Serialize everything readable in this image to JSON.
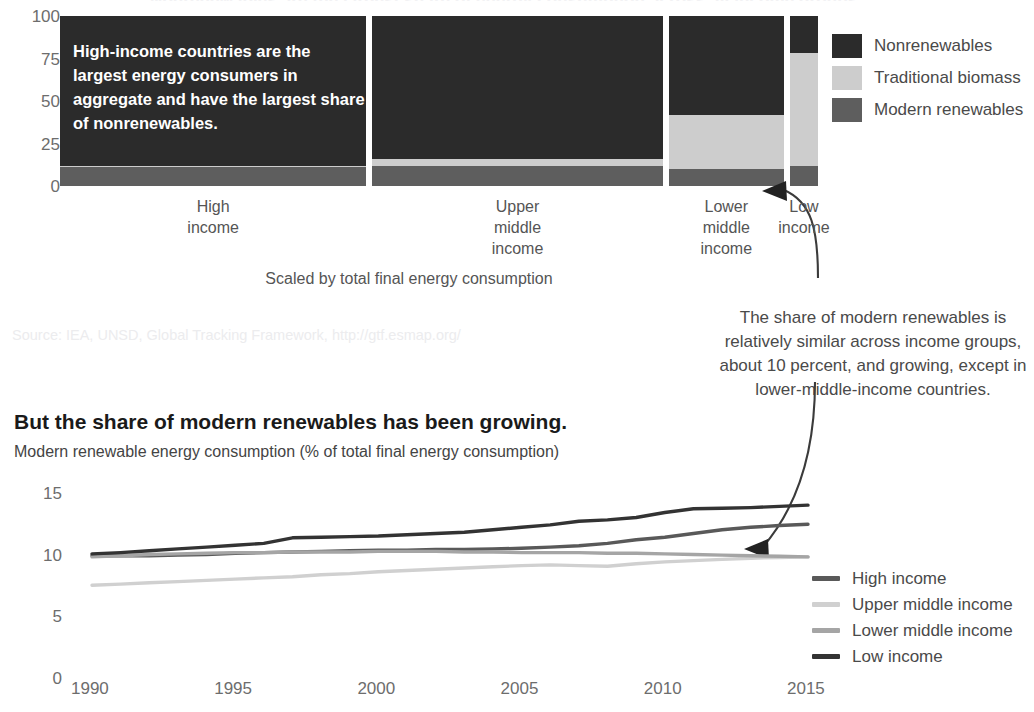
{
  "cutoff_title": "Nonrenewables are the largest share of energy consumption across all income groups.",
  "mekko": {
    "y_ticks": [
      "100",
      "75",
      "50",
      "25",
      "0"
    ],
    "callout": "High-income countries are the largest energy consumers in aggregate and have the largest share of nonrenewables.",
    "scaled_note": "Scaled by total final energy consumption",
    "source": "Source: IEA, UNSD, Global Tracking Framework, http://gtf.esmap.org/",
    "legend": [
      {
        "label": "Nonrenewables",
        "color": "#2b2b2b"
      },
      {
        "label": "Traditional biomass",
        "color": "#cdcdcd"
      },
      {
        "label": "Modern renewables",
        "color": "#5e5e5e"
      }
    ]
  },
  "annotation": "The share of modern renewables is relatively similar across income groups, about 10 percent, and growing, except in lower-middle-income countries.",
  "line": {
    "title": "But the share of modern renewables has been growing.",
    "subtitle": "Modern renewable energy consumption (% of total final energy consumption)",
    "legend": [
      {
        "label": "High income",
        "color": "#595959"
      },
      {
        "label": "Upper middle income",
        "color": "#d0d0d0"
      },
      {
        "label": "Lower middle income",
        "color": "#a5a5a5"
      },
      {
        "label": "Low income",
        "color": "#333333"
      }
    ]
  },
  "chart_data": [
    {
      "type": "bar",
      "subtype": "marimekko-stacked-100",
      "title": "Energy consumption composition by income group",
      "xlabel": "Scaled by total final energy consumption",
      "ylabel": "% of total final energy consumption",
      "ylim": [
        0,
        100
      ],
      "y_ticks": [
        0,
        25,
        50,
        75,
        100
      ],
      "grid": false,
      "legend_position": "right",
      "categories": [
        "High income",
        "Upper middle income",
        "Lower middle income",
        "Low income"
      ],
      "category_widths_pct": [
        40.4,
        38.3,
        15.2,
        3.7
      ],
      "series": [
        {
          "name": "Nonrenewables",
          "color": "#2b2b2b",
          "values": [
            88,
            84,
            58,
            22
          ]
        },
        {
          "name": "Traditional biomass",
          "color": "#cdcdcd",
          "values": [
            1,
            4,
            32,
            66
          ]
        },
        {
          "name": "Modern renewables",
          "color": "#5e5e5e",
          "values": [
            11,
            12,
            10,
            12
          ]
        }
      ]
    },
    {
      "type": "line",
      "title": "But the share of modern renewables has been growing.",
      "subtitle": "Modern renewable energy consumption (% of total final energy consumption)",
      "xlabel": "",
      "ylabel": "Modern renewable energy consumption (% of total final energy consumption)",
      "xlim": [
        1990,
        2015
      ],
      "ylim": [
        0,
        15
      ],
      "x_ticks": [
        1990,
        1995,
        2000,
        2005,
        2010,
        2015
      ],
      "y_ticks": [
        0,
        5,
        10,
        15
      ],
      "grid": false,
      "legend_position": "right",
      "x": [
        1990,
        1991,
        1992,
        1993,
        1994,
        1995,
        1996,
        1997,
        1998,
        1999,
        2000,
        2001,
        2002,
        2003,
        2004,
        2005,
        2006,
        2007,
        2008,
        2009,
        2010,
        2011,
        2012,
        2013,
        2014,
        2015
      ],
      "series": [
        {
          "name": "High income",
          "color": "#595959",
          "values": [
            8.7,
            8.7,
            8.7,
            8.75,
            8.8,
            8.9,
            8.95,
            9.0,
            9.05,
            9.1,
            9.15,
            9.15,
            9.2,
            9.2,
            9.25,
            9.3,
            9.4,
            9.5,
            9.7,
            10.0,
            10.2,
            10.5,
            10.8,
            11.0,
            11.15,
            11.25
          ]
        },
        {
          "name": "Upper middle income",
          "color": "#d0d0d0",
          "values": [
            6.3,
            6.4,
            6.5,
            6.6,
            6.7,
            6.8,
            6.9,
            7.0,
            7.15,
            7.25,
            7.4,
            7.5,
            7.6,
            7.7,
            7.8,
            7.9,
            7.95,
            7.9,
            7.85,
            8.05,
            8.2,
            8.3,
            8.4,
            8.5,
            8.55,
            8.6
          ]
        },
        {
          "name": "Lower middle income",
          "color": "#a5a5a5",
          "values": [
            8.6,
            8.7,
            8.8,
            8.85,
            8.9,
            8.95,
            8.95,
            9.0,
            9.0,
            9.0,
            9.05,
            9.05,
            9.05,
            9.0,
            9.0,
            8.95,
            8.95,
            8.95,
            8.9,
            8.9,
            8.85,
            8.8,
            8.75,
            8.7,
            8.65,
            8.6
          ]
        },
        {
          "name": "Low income",
          "color": "#333333",
          "values": [
            8.85,
            8.95,
            9.1,
            9.25,
            9.4,
            9.55,
            9.7,
            10.15,
            10.2,
            10.25,
            10.3,
            10.4,
            10.5,
            10.6,
            10.8,
            11.0,
            11.2,
            11.5,
            11.6,
            11.8,
            12.2,
            12.5,
            12.55,
            12.6,
            12.7,
            12.8
          ]
        }
      ]
    }
  ]
}
